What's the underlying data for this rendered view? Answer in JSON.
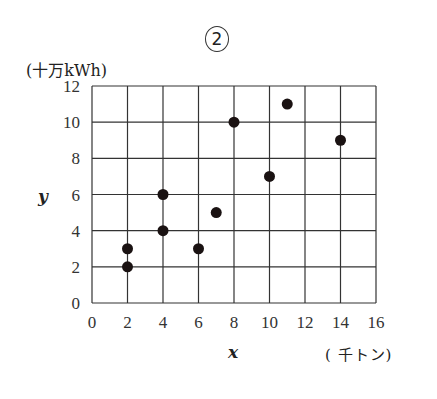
{
  "figure": {
    "panel_label": "2",
    "y_unit_label": "(十万kWh)",
    "x_unit_label": "( 千トン)",
    "x_var": "x",
    "y_var": "y"
  },
  "chart_data": {
    "type": "scatter",
    "title": "②",
    "xlabel": "x (千トン)",
    "ylabel": "y (十万kWh)",
    "xlim": [
      0,
      16
    ],
    "ylim": [
      0,
      12
    ],
    "x_ticks": [
      0,
      2,
      4,
      6,
      8,
      10,
      12,
      14,
      16
    ],
    "y_ticks": [
      0,
      2,
      4,
      6,
      8,
      10,
      12
    ],
    "grid": true,
    "legend": null,
    "points": [
      {
        "x": 2,
        "y": 2
      },
      {
        "x": 2,
        "y": 3
      },
      {
        "x": 4,
        "y": 4
      },
      {
        "x": 4,
        "y": 6
      },
      {
        "x": 6,
        "y": 3
      },
      {
        "x": 7,
        "y": 5
      },
      {
        "x": 8,
        "y": 10
      },
      {
        "x": 10,
        "y": 7
      },
      {
        "x": 11,
        "y": 11
      },
      {
        "x": 14,
        "y": 9
      }
    ]
  }
}
